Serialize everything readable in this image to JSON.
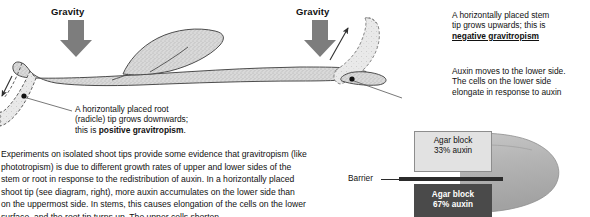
{
  "figure": {
    "gravity_label_left": "Gravity",
    "gravity_label_right": "Gravity",
    "annotations": {
      "root": {
        "line1": "A horizontally placed root",
        "line2": "(radicle) tip grows downwards;",
        "line3_prefix": "this is ",
        "line3_bold": "positive gravitropism",
        "line3_suffix": "."
      },
      "stem": {
        "line1": "A horizontally placed stem",
        "line2": "tip grows upwards; this is",
        "line3_bold": "negative gravitropism"
      },
      "auxin": {
        "line1": "Auxin moves to the lower side.",
        "line2": "The cells on the lower side",
        "line3": "elongate in response to auxin"
      }
    }
  },
  "body": {
    "line1": "Experiments on isolated shoot tips provide some evidence that gravitropism (like",
    "line2": "phototropism) is due to different growth rates of upper and lower sides of the",
    "line3": "stem or root in response to the redistribution of auxin. In a horizontally placed",
    "line4": "shoot tip (see diagram, right), more auxin accumulates on the lower side  than",
    "line5": "on the uppermost side. In stems, this causes elongation of the cells on the lower",
    "line6": "surface, and the root tip turns up. The upper cells shorten."
  },
  "experiment": {
    "barrier_label": "Barrier",
    "agar_top": {
      "line1": "Agar block",
      "line2": "33% auxin"
    },
    "agar_bottom": {
      "line1": "Agar block",
      "line2": "67% auxin"
    }
  },
  "colors": {
    "plant_fill": "#d7d7d7",
    "plant_stroke": "#4d4d4d",
    "arrow_gray": "#7d7d7d",
    "tip_fill": "#e6e6e6",
    "agar_light": "#e2e2e2",
    "agar_dark": "#4a4a4a",
    "barrier": "#2b2b2b",
    "shoot_fill": "#b9b9b9",
    "text": "#111111"
  },
  "icons": {
    "gravity_arrow": "down-arrow-icon",
    "root_growth_arrow": "down-left-arrow-icon",
    "stem_growth_arrow": "up-right-arrow-icon",
    "auxin_dot": "auxin-dot-icon"
  }
}
